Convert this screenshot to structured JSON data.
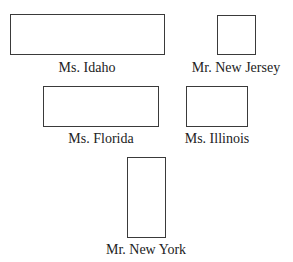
{
  "diagram": {
    "shapes": [
      {
        "id": "idaho",
        "label": "Ms. Idaho",
        "box": {
          "left": 10,
          "top": 14,
          "width": 155,
          "height": 41
        },
        "label_pos": {
          "cx": 87,
          "top": 60
        }
      },
      {
        "id": "new-jersey",
        "label": "Mr. New Jersey",
        "box": {
          "left": 217,
          "top": 15,
          "width": 39,
          "height": 40
        },
        "label_pos": {
          "cx": 236,
          "top": 60
        }
      },
      {
        "id": "florida",
        "label": "Ms. Florida",
        "box": {
          "left": 43,
          "top": 86,
          "width": 116,
          "height": 41
        },
        "label_pos": {
          "cx": 101,
          "top": 131
        }
      },
      {
        "id": "illinois",
        "label": "Ms. Illinois",
        "box": {
          "left": 186,
          "top": 86,
          "width": 62,
          "height": 41
        },
        "label_pos": {
          "cx": 217,
          "top": 131
        }
      },
      {
        "id": "new-york",
        "label": "Mr. New York",
        "box": {
          "left": 127,
          "top": 157,
          "width": 39,
          "height": 81
        },
        "label_pos": {
          "cx": 146,
          "top": 242
        }
      }
    ]
  }
}
